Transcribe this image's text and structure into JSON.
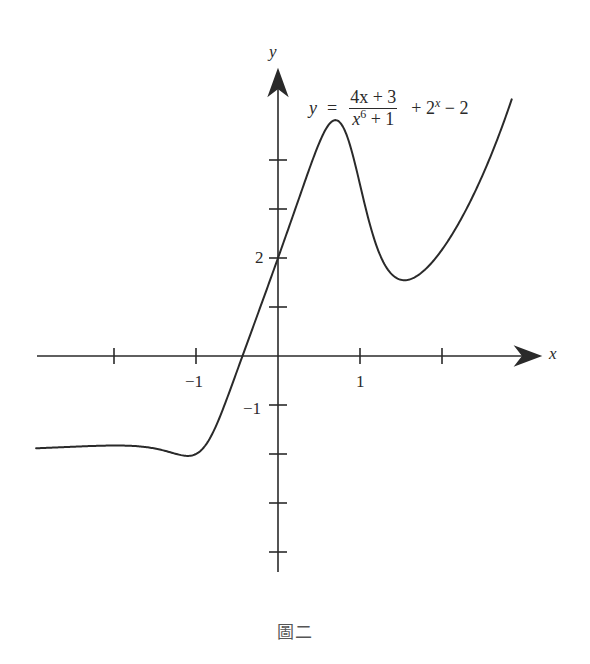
{
  "figure": {
    "caption": "圖二",
    "formula": {
      "lhs": "y",
      "equals": "=",
      "numerator": "4x + 3",
      "denominator_base": "x",
      "denominator_exp": "6",
      "denominator_rest": "+ 1",
      "tail_plus": "+ 2",
      "tail_exp": "x",
      "tail_minus": "− 2"
    },
    "axes": {
      "x_label": "x",
      "y_label": "y",
      "x_tick_labels": [
        {
          "value": -1,
          "text": "−1"
        },
        {
          "value": 1,
          "text": "1"
        }
      ],
      "y_tick_labels": [
        {
          "value": 2,
          "text": "2"
        },
        {
          "value": -1,
          "text": "−1"
        }
      ]
    }
  },
  "chart_data": {
    "type": "line",
    "caption": "圖二",
    "xlabel": "x",
    "ylabel": "y",
    "xlim": [
      -3.0,
      3.2
    ],
    "ylim": [
      -4.5,
      5.8
    ],
    "x_ticks": [
      -2,
      -1,
      1,
      2
    ],
    "x_tick_labels": {
      "-1": "−1",
      "1": "1"
    },
    "y_ticks": [
      -4,
      -3,
      -2,
      -1,
      1,
      2,
      3,
      4
    ],
    "y_tick_labels": {
      "2": "2",
      "-1": "−1"
    },
    "grid": false,
    "legend": null,
    "function": "(4x+3)/(x^6+1) + 2^x - 2",
    "domain_plotted": [
      -2.95,
      2.85
    ],
    "series": [
      {
        "name": "y = (4x+3)/(x^6+1) + 2^x − 2",
        "x": [
          -2.95,
          -2.5,
          -2.0,
          -1.5,
          -1.25,
          -1.1,
          -1.0,
          -0.75,
          -0.5,
          -0.25,
          0.0,
          0.25,
          0.5,
          0.6,
          0.7,
          0.8,
          1.0,
          1.25,
          1.5,
          1.75,
          2.0,
          2.5,
          2.85
        ],
        "y": [
          -1.88,
          -1.85,
          -1.83,
          -1.89,
          -2.0,
          -2.04,
          -2.0,
          -1.41,
          -0.31,
          0.84,
          2.0,
          3.19,
          4.34,
          4.68,
          4.82,
          4.65,
          3.5,
          2.04,
          1.56,
          1.7,
          2.17,
          3.71,
          5.22
        ]
      }
    ],
    "annotations": [
      {
        "text": "y = (4x+3)/(x^6+1) + 2^x − 2",
        "position": "upper right near peak"
      },
      {
        "text": "local max ≈ (0.7, 4.8)"
      },
      {
        "text": "local min ≈ (1.55, 1.55)"
      },
      {
        "text": "local min ≈ (-1.1, -2.04)"
      },
      {
        "text": "y-intercept (0, 2)"
      }
    ]
  }
}
